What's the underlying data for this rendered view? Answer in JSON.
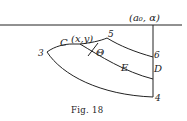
{
  "figure": {
    "caption": "Fig. 18",
    "corner_label": "(a₀, α)",
    "point_label": "(x,y)",
    "angle_label": "Θ",
    "labels": {
      "C": "C",
      "E": "E",
      "D": "D"
    },
    "numbers": {
      "n3": "3",
      "n4": "4",
      "n5": "5",
      "n6": "6"
    }
  }
}
